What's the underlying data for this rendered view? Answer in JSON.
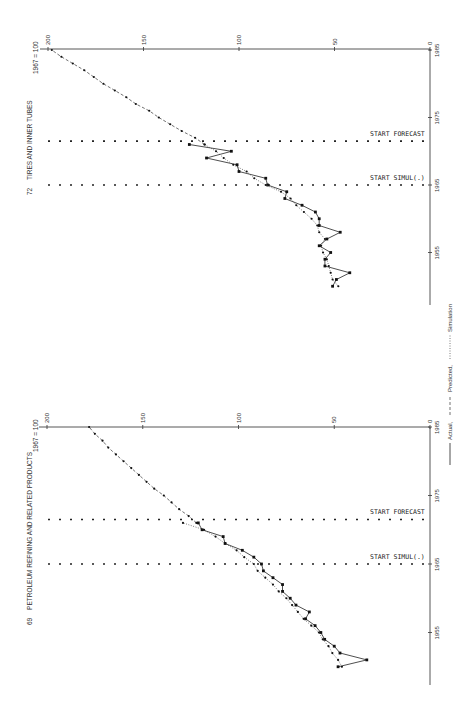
{
  "legend": {
    "actual": "Actual,",
    "predicted": "Predicted,",
    "simulation": "Simulation"
  },
  "chart_data": [
    {
      "type": "line",
      "id": "tires",
      "number": "72",
      "title": "TIRES AND INNER TUBES",
      "index_label": "1967 = 100",
      "xlabel": "Year",
      "ylabel": "Index (1967 = 100)",
      "ylim": [
        0,
        200
      ],
      "xlim": [
        1948,
        1985
      ],
      "y_ticks": [
        0,
        50,
        100,
        150,
        200
      ],
      "x_ticks": [
        1955,
        1965,
        1975,
        1985
      ],
      "annotations": [
        {
          "label": "START SIMUL(.)",
          "year": 1965
        },
        {
          "label": "START FORECAST",
          "year": 1971.5
        }
      ],
      "grid": false,
      "series": [
        {
          "name": "Actual",
          "x": [
            1950,
            1951,
            1952,
            1953,
            1954,
            1955,
            1956,
            1957,
            1958,
            1959,
            1960,
            1961,
            1962,
            1963,
            1964,
            1965,
            1966,
            1967,
            1968,
            1969,
            1970,
            1971
          ],
          "values": [
            51,
            49,
            42,
            55,
            55,
            52,
            58,
            54,
            47,
            58,
            58,
            60,
            67,
            76,
            75,
            85,
            86,
            100,
            101,
            117,
            104,
            126
          ]
        },
        {
          "name": "Predicted",
          "x": [
            1971,
            1972,
            1973,
            1974,
            1975,
            1976,
            1977,
            1978,
            1979,
            1980,
            1981,
            1982,
            1983,
            1984,
            1985
          ],
          "values": [
            118,
            123,
            130,
            136,
            142,
            147,
            154,
            159,
            165,
            171,
            176,
            181,
            187,
            193,
            198
          ]
        },
        {
          "name": "Simulation",
          "x": [
            1950,
            1951,
            1952,
            1953,
            1954,
            1955,
            1956,
            1957,
            1958,
            1959,
            1960,
            1961,
            1962,
            1963,
            1964,
            1965,
            1966,
            1967,
            1968,
            1969,
            1970,
            1971
          ],
          "values": [
            48,
            51,
            52,
            53,
            54,
            56,
            57,
            55,
            58,
            59,
            62,
            66,
            70,
            73,
            78,
            86,
            92,
            96,
            103,
            108,
            112,
            118
          ]
        }
      ]
    },
    {
      "type": "line",
      "id": "petroleum",
      "number": "69",
      "title": "PETROLEUM REFINING AND RELATED PRODUCTS",
      "index_label": "1967 = 100",
      "xlabel": "Year",
      "ylabel": "Index (1967 = 100)",
      "ylim": [
        0,
        200
      ],
      "xlim": [
        1948,
        1985
      ],
      "y_ticks": [
        0,
        50,
        100,
        150,
        200
      ],
      "x_ticks": [
        1955,
        1965,
        1975,
        1985
      ],
      "annotations": [
        {
          "label": "START SIMUL(.)",
          "year": 1965
        },
        {
          "label": "START FORECAST",
          "year": 1971.5
        }
      ],
      "grid": false,
      "series": [
        {
          "name": "Actual",
          "x": [
            1950,
            1951,
            1952,
            1953,
            1954,
            1955,
            1956,
            1957,
            1958,
            1959,
            1960,
            1961,
            1962,
            1963,
            1964,
            1965,
            1966,
            1967,
            1968,
            1969,
            1970,
            1971
          ],
          "values": [
            48,
            33,
            47,
            50,
            55,
            57,
            60,
            65,
            63,
            70,
            73,
            77,
            77,
            82,
            87,
            88,
            92,
            98,
            107,
            108,
            119,
            121
          ]
        },
        {
          "name": "Predicted",
          "x": [
            1971,
            1972,
            1973,
            1974,
            1975,
            1976,
            1977,
            1978,
            1979,
            1980,
            1981,
            1982,
            1983,
            1984,
            1985
          ],
          "values": [
            122,
            126,
            131,
            135,
            139,
            144,
            148,
            152,
            156,
            160,
            164,
            168,
            171,
            175,
            178
          ]
        },
        {
          "name": "Simulation",
          "x": [
            1950,
            1951,
            1952,
            1953,
            1954,
            1955,
            1956,
            1957,
            1958,
            1959,
            1960,
            1961,
            1962,
            1963,
            1964,
            1965,
            1966,
            1967,
            1968,
            1969,
            1970,
            1971
          ],
          "values": [
            46,
            48,
            51,
            53,
            56,
            58,
            62,
            66,
            69,
            72,
            75,
            79,
            82,
            86,
            90,
            92,
            97,
            101,
            107,
            112,
            118,
            129
          ]
        }
      ]
    }
  ]
}
